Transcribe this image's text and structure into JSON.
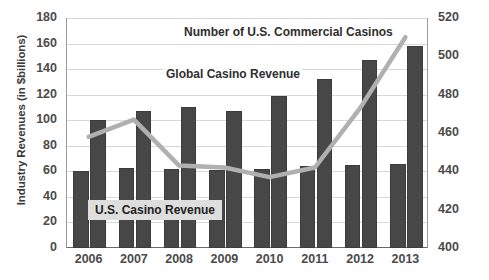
{
  "chart_data": {
    "type": "bar",
    "title": "",
    "categories": [
      "2006",
      "2007",
      "2008",
      "2009",
      "2010",
      "2011",
      "2012",
      "2013"
    ],
    "series": [
      {
        "name": "U.S. Casino Revenue",
        "axis": "left",
        "type": "bar",
        "values": [
          60,
          63,
          62,
          61,
          62,
          64,
          65,
          66
        ]
      },
      {
        "name": "Global Casino Revenue",
        "axis": "left",
        "type": "bar",
        "values": [
          100,
          107,
          110,
          107,
          119,
          132,
          147,
          158
        ]
      },
      {
        "name": "Number of U.S. Commercial Casinos",
        "axis": "right",
        "type": "line",
        "values": [
          458,
          467,
          443,
          442,
          437,
          442,
          473,
          510
        ]
      }
    ],
    "xlabel": "",
    "ylabel": "Industry Revenues (in $billions)",
    "ylabel_right": "",
    "ylim": [
      0,
      180
    ],
    "ylim_right": [
      400,
      520
    ],
    "yticks": [
      0,
      20,
      40,
      60,
      80,
      100,
      120,
      140,
      160,
      180
    ],
    "yticks_right": [
      400,
      420,
      440,
      460,
      480,
      500,
      520
    ],
    "grid": true,
    "legend": "annotations-inline",
    "annotations": [
      {
        "id": "casinos",
        "text": "Number of U.S. Commercial Casinos"
      },
      {
        "id": "global",
        "text": "Global Casino Revenue"
      },
      {
        "id": "us",
        "text": "U.S. Casino Revenue"
      }
    ],
    "colors": {
      "bar": "#474747",
      "line": "#b0b0b0",
      "grid": "#d9d9d9",
      "axis": "#6a6a6a",
      "text": "#3a3a3a"
    }
  },
  "axes": {
    "y_left_title": "Industry Revenues (in $billions)",
    "y_left_ticks": [
      "180",
      "160",
      "140",
      "120",
      "100",
      "80",
      "60",
      "40",
      "20",
      "0"
    ],
    "y_right_ticks": [
      "520",
      "500",
      "480",
      "460",
      "440",
      "420",
      "400"
    ],
    "x_ticks": [
      "2006",
      "2007",
      "2008",
      "2009",
      "2010",
      "2011",
      "2012",
      "2013"
    ]
  },
  "annotations": {
    "casinos_label": "Number of U.S. Commercial Casinos",
    "global_label": "Global Casino Revenue",
    "us_label": "U.S. Casino Revenue"
  }
}
